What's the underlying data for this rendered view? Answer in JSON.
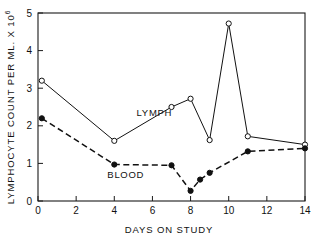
{
  "chart_data": {
    "type": "line",
    "title": "",
    "subtitle": "",
    "xlabel": "DAYS ON STUDY",
    "ylabel": "LYMPHOCYTE COUNT PER ML. X 10",
    "ylabel_superscript": "6",
    "xlim": [
      0,
      14
    ],
    "ylim": [
      0,
      5
    ],
    "xticks": [
      0,
      2,
      4,
      6,
      8,
      10,
      12,
      14
    ],
    "xtick_labels": [
      "0",
      "2",
      "4",
      "6",
      "8",
      "10",
      "12",
      "14"
    ],
    "yticks": [
      0,
      1,
      2,
      3,
      4,
      5
    ],
    "ytick_labels": [
      "0",
      "1",
      "2",
      "3",
      "4",
      "5"
    ],
    "grid": false,
    "legend_position": "inline-annotation",
    "series": [
      {
        "name": "LYMPH",
        "marker": "open-circle",
        "linestyle": "solid",
        "color": "#111111",
        "label_x": 6.1,
        "label_y": 2.27,
        "points": [
          {
            "x": 0.2,
            "y": 3.2
          },
          {
            "x": 4.0,
            "y": 1.6
          },
          {
            "x": 7.0,
            "y": 2.5
          },
          {
            "x": 8.0,
            "y": 2.72
          },
          {
            "x": 9.0,
            "y": 1.62
          },
          {
            "x": 10.0,
            "y": 4.72
          },
          {
            "x": 11.0,
            "y": 1.72
          },
          {
            "x": 14.0,
            "y": 1.5
          }
        ]
      },
      {
        "name": "BLOOD",
        "marker": "filled-circle",
        "linestyle": "dashed",
        "color": "#111111",
        "label_x": 4.6,
        "label_y": 0.62,
        "points": [
          {
            "x": 0.2,
            "y": 2.2
          },
          {
            "x": 4.0,
            "y": 0.97
          },
          {
            "x": 7.0,
            "y": 0.95
          },
          {
            "x": 8.0,
            "y": 0.27
          },
          {
            "x": 8.5,
            "y": 0.57
          },
          {
            "x": 9.0,
            "y": 0.75
          },
          {
            "x": 11.0,
            "y": 1.32
          },
          {
            "x": 14.0,
            "y": 1.4
          }
        ]
      }
    ]
  }
}
